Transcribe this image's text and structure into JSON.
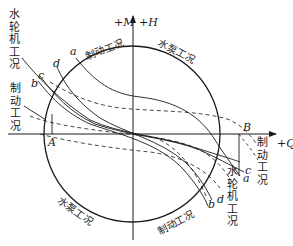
{
  "axes": {
    "vertical_label_m": "+M",
    "vertical_label_h": "+H",
    "horizontal_label": "+Q"
  },
  "points": {
    "A": "A",
    "B": "B"
  },
  "curves": {
    "a": "a",
    "b": "b",
    "c": "c",
    "d": "d"
  },
  "regions": {
    "turbine_top_left": "水轮机工况",
    "braking_left": "制动工况",
    "braking_top": "制动工况",
    "pump_top_right": "水泵工况",
    "braking_right": "制动工况",
    "turbine_bottom_right": "水轮机工况",
    "pump_bottom_left": "水泵工况",
    "braking_bottom": "制动工况"
  },
  "bottom_labels": {
    "a_end": "a",
    "b_end": "b",
    "c_end": "c",
    "d_end": "d"
  },
  "colors": {
    "line": "#1a1a1a",
    "background": "#ffffff"
  }
}
